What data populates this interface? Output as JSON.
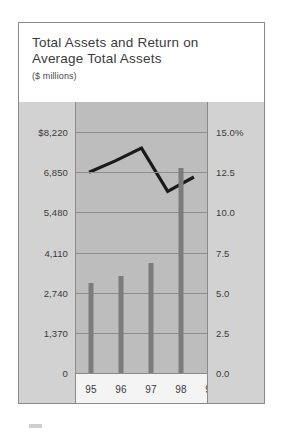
{
  "figure": {
    "title": "Total Assets and Return on\nAverage Total Assets",
    "subtitle": "($ millions)"
  },
  "left_axis": {
    "ticks": [
      "$8,220",
      "6,850",
      "5,480",
      "4,110",
      "2,740",
      "1,370",
      "0"
    ]
  },
  "right_axis": {
    "ticks": [
      "15.0%",
      "12.5",
      "10.0",
      "7.5",
      "5.0",
      "2.5",
      "0.0"
    ]
  },
  "x_axis": {
    "labels": [
      "95",
      "96",
      "97",
      "98",
      "99"
    ]
  },
  "colors": {
    "frame": "#8a8a8a",
    "axis_panel": "#d2d2d2",
    "plot_panel": "#bdbdbd",
    "gridline": "#8d8d8d",
    "bar": "#7c7c7c",
    "line": "#1a1a1a",
    "xaxis_strip": "#f4f4f4",
    "title_text": "#3b3b3b"
  },
  "chart_data": {
    "type": "bar",
    "title": "Total Assets and Return on Average Total Assets",
    "subtitle": "($ millions)",
    "categories": [
      "95",
      "96",
      "97",
      "98",
      "99"
    ],
    "xlabel": "",
    "ylabel": "Total Assets ($ millions)",
    "ylim": [
      0,
      8220
    ],
    "yticks": [
      0,
      1370,
      2740,
      4110,
      5480,
      6850,
      8220
    ],
    "ytick_labels": [
      "0",
      "1,370",
      "2,740",
      "4,110",
      "5,480",
      "6,850",
      "$8,220"
    ],
    "y2label": "Return on Average Total Assets (%)",
    "y2lim": [
      0,
      15
    ],
    "y2ticks": [
      0,
      2.5,
      5,
      7.5,
      10,
      12.5,
      15
    ],
    "y2tick_labels": [
      "0.0",
      "2.5",
      "5.0",
      "7.5",
      "10.0",
      "12.5",
      "15.0%"
    ],
    "grid": true,
    "legend": "none",
    "series": [
      {
        "name": "Total Assets",
        "type": "bar",
        "axis": "left",
        "values": [
          3070,
          3310,
          3750,
          6990,
          7330
        ]
      },
      {
        "name": "Return on Average Total Assets",
        "type": "line",
        "axis": "right",
        "values": [
          12.5,
          13.2,
          14.0,
          11.3,
          12.2
        ]
      }
    ]
  }
}
